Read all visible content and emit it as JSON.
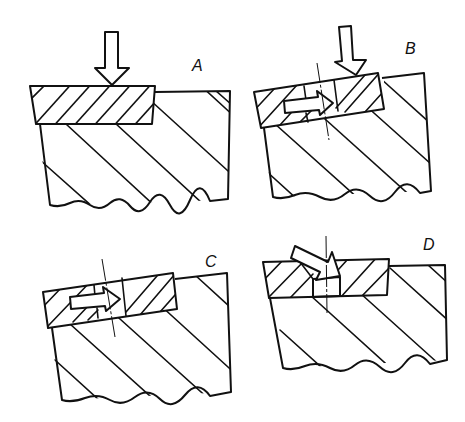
{
  "figure": {
    "panels": [
      {
        "id": "A",
        "label": "A",
        "caption_role": "insert pressed straight down onto surface"
      },
      {
        "id": "B",
        "label": "B",
        "caption_role": "insert with plug driven sideways under pressure"
      },
      {
        "id": "C",
        "label": "C",
        "caption_role": "insert seated with plug displaced"
      },
      {
        "id": "D",
        "label": "D",
        "caption_role": "angled force into pocket"
      }
    ],
    "colors": {
      "ink": "#111111",
      "background": "#ffffff"
    }
  }
}
